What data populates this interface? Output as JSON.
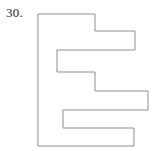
{
  "page": {
    "width": 162,
    "height": 151,
    "background_color": "#ffffff"
  },
  "problem": {
    "number_label": "30.",
    "number_color": "#1c1c1c"
  },
  "figure": {
    "name": "e-shaped-rectilinear-polygon",
    "stroke_color": "#8c8c8c",
    "fill_color": "#ffffff",
    "stroke_width": 1,
    "vertices": [
      [
        38,
        14
      ],
      [
        95,
        14
      ],
      [
        95,
        31
      ],
      [
        135,
        31
      ],
      [
        135,
        50
      ],
      [
        57,
        50
      ],
      [
        57,
        72
      ],
      [
        95,
        72
      ],
      [
        95,
        91
      ],
      [
        148,
        91
      ],
      [
        148,
        110
      ],
      [
        63,
        110
      ],
      [
        63,
        128
      ],
      [
        134,
        128
      ],
      [
        134,
        146
      ],
      [
        38,
        146
      ]
    ],
    "points_attr": "38,14 95,14 95,31 135,31 135,50 57,50 57,72 95,72 95,91 148,91 148,110 63,110 63,128 134,128 134,146 38,146"
  }
}
